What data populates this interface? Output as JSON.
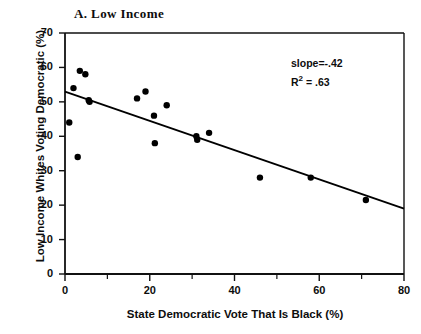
{
  "chart_data": {
    "type": "scatter",
    "title": "A. Low Income",
    "xlabel": "State Democratic Vote That Is Black (%)",
    "ylabel": "Low Income Whites Voting Democratic (%)",
    "xlim": [
      0,
      80
    ],
    "ylim": [
      0,
      70
    ],
    "xticks": [
      0,
      20,
      40,
      60,
      80
    ],
    "xticks_minor": [
      10,
      30,
      50,
      70
    ],
    "yticks": [
      0,
      10,
      20,
      30,
      40,
      50,
      60,
      70
    ],
    "grid": false,
    "legend": null,
    "marker_color": "#000000",
    "line_color": "#000000",
    "points": [
      {
        "x": 1.0,
        "y": 44.0
      },
      {
        "x": 2.0,
        "y": 54.0
      },
      {
        "x": 3.0,
        "y": 34.0
      },
      {
        "x": 3.5,
        "y": 59.0
      },
      {
        "x": 4.8,
        "y": 58.0
      },
      {
        "x": 5.6,
        "y": 50.5
      },
      {
        "x": 5.8,
        "y": 50.0
      },
      {
        "x": 17.0,
        "y": 51.0
      },
      {
        "x": 19.0,
        "y": 53.0
      },
      {
        "x": 21.0,
        "y": 46.0
      },
      {
        "x": 21.2,
        "y": 38.0
      },
      {
        "x": 24.0,
        "y": 49.0
      },
      {
        "x": 31.0,
        "y": 40.0
      },
      {
        "x": 31.2,
        "y": 39.0
      },
      {
        "x": 34.0,
        "y": 41.0
      },
      {
        "x": 46.0,
        "y": 28.0
      },
      {
        "x": 58.0,
        "y": 28.0
      },
      {
        "x": 71.0,
        "y": 21.5
      }
    ],
    "fit_line": {
      "x_start": 0,
      "y_start": 53.0,
      "x_end": 80,
      "y_end": 19.0
    },
    "annotations": {
      "slope_label": "slope=-.42",
      "r2_prefix": "R",
      "r2_exponent": "2",
      "r2_value": " = .63"
    }
  }
}
